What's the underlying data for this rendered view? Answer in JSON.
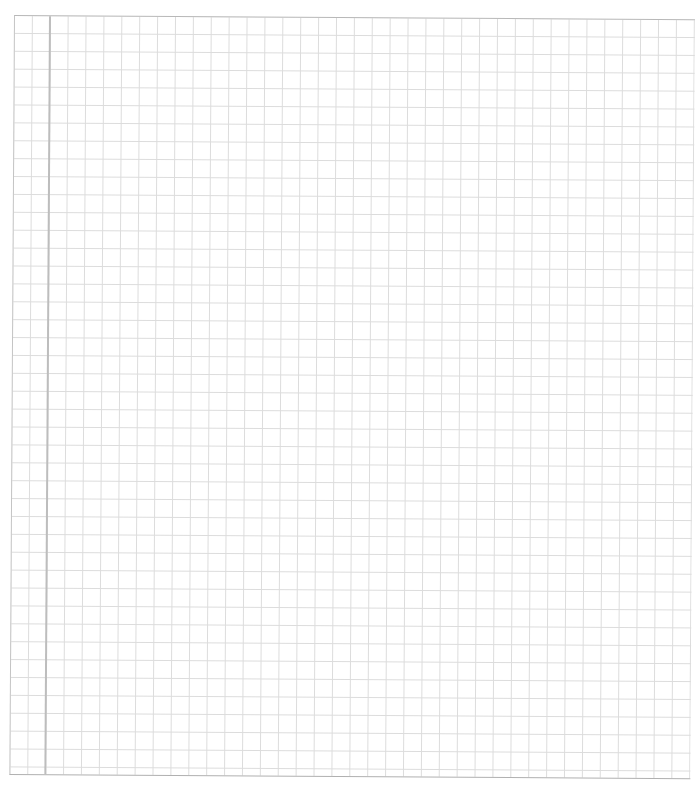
{
  "page": {
    "type": "graph-paper",
    "grid_spacing_px": 17.9,
    "colors": {
      "background": "#ffffff",
      "grid_line": "#dcdcdc",
      "border": "#b8b8b8",
      "margin_line": "#bdbdbd"
    }
  }
}
